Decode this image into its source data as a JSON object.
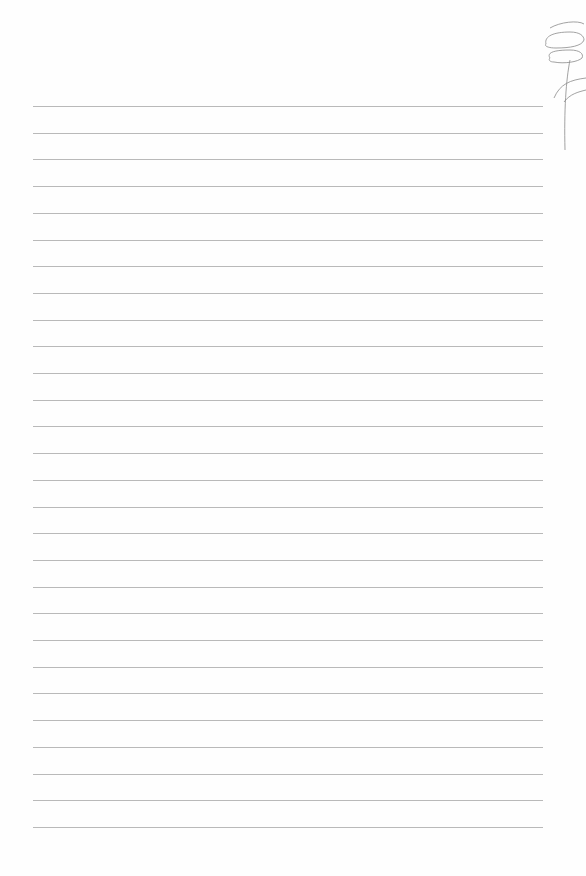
{
  "page": {
    "type": "lined-paper",
    "background_color": "#fefefe",
    "rule_color": "#b9b9b9",
    "rule_count": 28,
    "first_rule_y": 106,
    "rule_spacing": 26.7,
    "rule_left": 33,
    "rule_width": 510
  },
  "sketch": {
    "icon": "pencil-flower-sketch-icon",
    "stroke_color": "#8a8a8a"
  }
}
